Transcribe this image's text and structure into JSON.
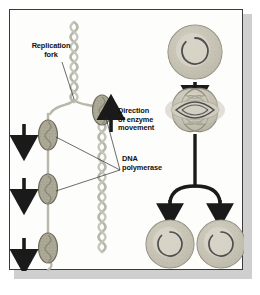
{
  "figure": {
    "frame_border_color": "#3a3a3a",
    "panel_background": "#fdfdfc",
    "shadow_color": "#cfcfcf"
  },
  "labels": {
    "replication_fork": "Replication\nfork",
    "direction_of_enzyme_movement": "Direction\nof enzyme\nmovement",
    "dna_polymerase": "DNA\npolymerase"
  },
  "colors": {
    "dna_strand": "#b7b7ab",
    "dna_strand_dark": "#9b9b90",
    "polymerase_fill": "#a9a694",
    "polymerase_stroke": "#6e6c5e",
    "cell_fill": "#c6c3b4",
    "cell_inner": "#d6d3c6",
    "cell_stroke": "#8d8a7c",
    "chromosome": "#4e4e4e",
    "arrow_black": "#1a1a1a",
    "arrow_gray": "#8e8e85",
    "leader_line": "#2b2b2b",
    "text": "#111111"
  },
  "left_panel": {
    "name": "replication-fork-diagram",
    "description": "Helical DNA strands branching at a replication fork with DNA polymerase enzymes moving along them",
    "dna_strands": [
      {
        "id": "parent-strand",
        "orientation": "vertical",
        "x": 64,
        "top": 14,
        "bottom": 80
      },
      {
        "id": "daughter-strand-left",
        "orientation": "vertical",
        "x": 38,
        "top": 82,
        "bottom": 250
      },
      {
        "id": "daughter-strand-right",
        "orientation": "vertical",
        "x": 92,
        "top": 82,
        "bottom": 250
      }
    ],
    "polymerases": [
      {
        "id": "polymerase-right-upper",
        "cx": 92,
        "cy": 100
      },
      {
        "id": "polymerase-left-upper",
        "cx": 38,
        "cy": 124
      },
      {
        "id": "polymerase-left-lower",
        "cx": 38,
        "cy": 178
      },
      {
        "id": "polymerase-left-bottom",
        "cx": 38,
        "cy": 238
      }
    ],
    "movement_arrows": [
      {
        "id": "movement-arrow-1",
        "x": 14,
        "y_from": 114,
        "y_to": 140,
        "direction": "down"
      },
      {
        "id": "movement-arrow-2",
        "x": 14,
        "y_from": 168,
        "y_to": 194,
        "direction": "down"
      },
      {
        "id": "movement-arrow-3",
        "x": 14,
        "y_from": 228,
        "y_to": 252,
        "direction": "down"
      }
    ],
    "enzyme_direction_arrow": {
      "id": "enzyme-direction-arrow",
      "x": 100,
      "y_from": 122,
      "y_to": 96,
      "direction": "up"
    }
  },
  "right_panel": {
    "name": "cell-division-sequence",
    "description": "A bacterial cell with a circular chromosome replicates, elongates and divides into two daughter cells",
    "stages": [
      {
        "id": "parent-cell",
        "label": "",
        "shape": "circle",
        "cx": 185,
        "cy": 42,
        "r": 27
      },
      {
        "id": "dividing-cell",
        "label": "",
        "shape": "dumbbell",
        "cx": 185,
        "cy": 100
      },
      {
        "id": "daughter-cell-left",
        "label": "",
        "shape": "circle",
        "cx": 158,
        "cy": 234,
        "r": 24
      },
      {
        "id": "daughter-cell-right",
        "label": "",
        "shape": "circle",
        "cx": 212,
        "cy": 234,
        "r": 24
      }
    ],
    "flow_arrows": [
      {
        "id": "division-arrow-top",
        "from": "parent-cell",
        "to": "dividing-cell",
        "direction": "down"
      },
      {
        "id": "division-arrow-split-left",
        "from": "dividing-cell",
        "to": "daughter-cell-left",
        "direction": "down"
      },
      {
        "id": "division-arrow-split-right",
        "from": "dividing-cell",
        "to": "daughter-cell-right",
        "direction": "down"
      }
    ]
  }
}
